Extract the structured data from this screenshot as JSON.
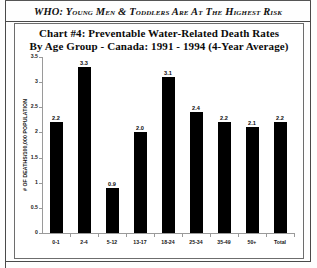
{
  "banner": {
    "text": "WHO:  Young Men & Toddlers Are At The Highest Risk"
  },
  "chart_data": {
    "type": "bar",
    "title": "Chart #4:  Preventable Water-Related Death Rates",
    "title_line2": "By Age Group  -  Canada:  1991 - 1994 (4-Year Average)",
    "subtitle": "",
    "xlabel": "",
    "ylabel": "# OF DEATHS/100,000 POPULATION",
    "categories": [
      "0-1",
      "2-4",
      "5-12",
      "13-17",
      "18-24",
      "25-34",
      "35-49",
      "50+",
      "Total"
    ],
    "values": [
      2.2,
      3.3,
      0.9,
      2.0,
      3.1,
      2.4,
      2.2,
      2.1,
      2.2
    ],
    "value_labels": [
      "2.2",
      "3.3",
      "0.9",
      "2.0",
      "3.1",
      "2.4",
      "2.2",
      "2.1",
      "2.2"
    ],
    "ylim": [
      0,
      3.5
    ],
    "yticks": [
      0,
      0.5,
      1,
      1.5,
      2,
      2.5,
      3,
      3.5
    ],
    "ytick_labels": [
      "0",
      "0.5",
      "1",
      "1.5",
      "2",
      "2.5",
      "3",
      "3.5"
    ],
    "grid": false,
    "legend": false,
    "bar_color": "#000000",
    "axis_color": "#9a9a9a"
  }
}
